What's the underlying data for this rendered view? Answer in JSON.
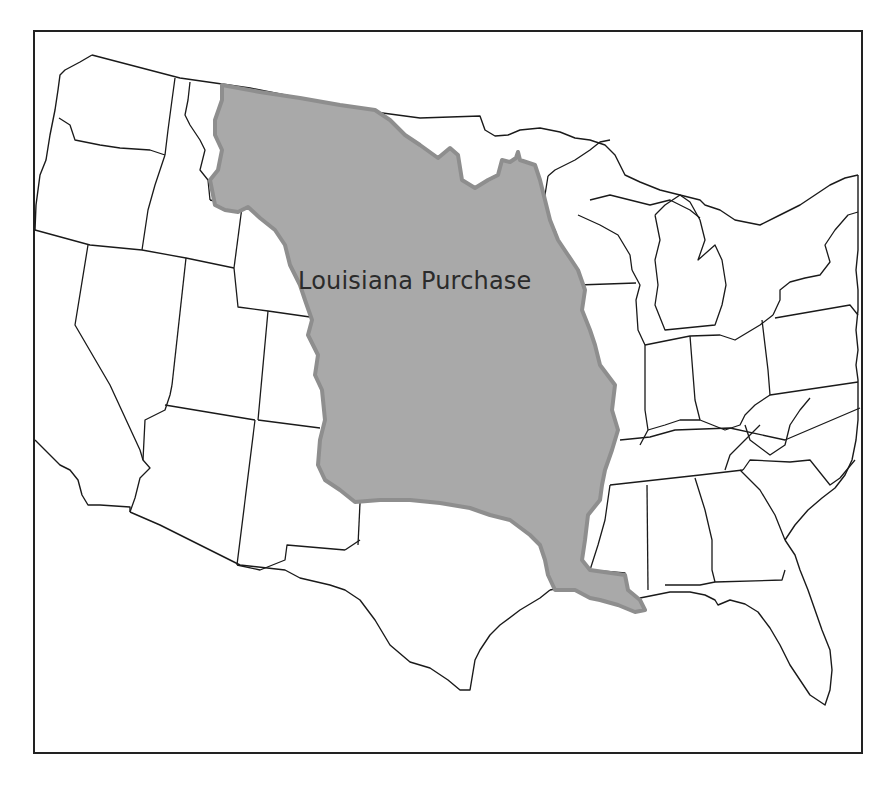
{
  "map": {
    "subject": "Contiguous United States with state boundaries",
    "highlighted_region": {
      "label": "Louisiana Purchase",
      "fill_color": "#a9a9a9",
      "border_color": "#8e8e8e"
    },
    "colors": {
      "background": "#ffffff",
      "state_lines": "#1a1a1a",
      "frame": "#222222"
    }
  }
}
